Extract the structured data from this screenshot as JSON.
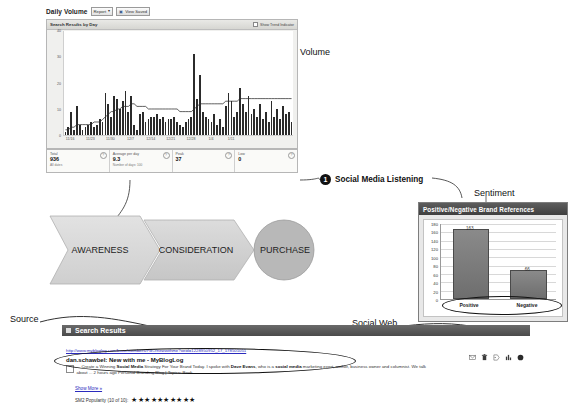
{
  "diagram": {
    "labels": {
      "volume": "Volume",
      "sentiment": "Sentiment",
      "source": "Source",
      "social_web": "Social Web"
    },
    "callout": {
      "number": "1",
      "text": "Social Media Listening"
    },
    "funnel": {
      "stages": [
        "AWARENESS",
        "CONSIDERATION",
        "PURCHASE"
      ]
    }
  },
  "volume_panel": {
    "title": "Daily Volume",
    "report_select": {
      "value": "Report",
      "caret": "▾"
    },
    "view_button": {
      "label": "View Saved",
      "icon": "disk-icon"
    },
    "card_header": "Search Results by Day",
    "card_header_checkbox": "Show Trend Indicator",
    "stats": [
      {
        "label": "Total",
        "value": "936",
        "sub": "All dates",
        "help": "?"
      },
      {
        "label": "Average per day",
        "value": "9.3",
        "sub": "Number of days: 100",
        "help": "?"
      },
      {
        "label": "Peak",
        "value": "37",
        "sub": "",
        "help": "?"
      },
      {
        "label": "Low",
        "value": "0",
        "sub": "",
        "help": "?"
      }
    ]
  },
  "sentiment_panel": {
    "title": "Positive/Negative Brand References"
  },
  "search_results": {
    "header": "Search Results",
    "result": {
      "url": "http://www.mybloglog.com/buzz/members/PBO/newwithme?oeid=1228950952_17_178501051",
      "title": "dan.schawbel: New with me - MyBlogLog",
      "snippet_pre": "... Create a Winning ",
      "snippet_b1": "Social Media",
      "snippet_mid1": " Strategy For Your Brand Today. I spoke with ",
      "snippet_b2": "Dave Evans",
      "snippet_mid2": ", who is a ",
      "snippet_b3": "social media",
      "snippet_post": " marketing exert, author, business owner and columnist. We talk about ...  2 hours ago Personal Branding Blog | Topics: Book ...",
      "show_more": "Show More »",
      "popularity_label": "SM2 Popularity (10 of 10):",
      "stars": "★★★★★★★★★★"
    },
    "action_icons": [
      "envelope-icon",
      "trash-icon",
      "tag-icon",
      "chart-icon",
      "circle-icon"
    ]
  },
  "chart_data": [
    {
      "type": "bar",
      "title": "Search Results by Day",
      "xlabel": "",
      "ylabel": "",
      "ylim": [
        0,
        40
      ],
      "yticks": [
        0,
        10,
        20,
        30,
        40
      ],
      "grid": false,
      "categories": [
        "11/16",
        "11/23",
        "11/30",
        "12/7",
        "12/14",
        "12/21",
        "12/28",
        "1/4",
        "1/11"
      ],
      "tick_positions": [
        2,
        9,
        16,
        23,
        30,
        37,
        44,
        51,
        58
      ],
      "values": [
        1,
        3,
        9,
        2,
        11,
        4,
        2,
        3,
        4,
        5,
        3,
        4,
        6,
        5,
        16,
        12,
        7,
        15,
        14,
        10,
        13,
        17,
        9,
        15,
        4,
        2,
        8,
        9,
        5,
        6,
        7,
        7,
        8,
        6,
        7,
        5,
        6,
        6,
        7,
        5,
        4,
        3,
        5,
        6,
        7,
        31,
        14,
        23,
        9,
        7,
        6,
        5,
        8,
        4,
        6,
        3,
        11,
        16,
        13,
        7,
        9,
        18,
        12,
        9,
        15,
        8,
        10,
        7,
        12,
        6,
        9,
        5,
        13,
        7,
        10,
        6,
        11,
        8,
        9,
        5
      ],
      "series": [
        {
          "name": "Trend",
          "type": "line",
          "values": [
            2,
            2,
            3,
            3,
            4,
            4,
            4,
            4,
            4,
            4,
            5,
            5,
            5,
            6,
            7,
            8,
            9,
            9,
            10,
            10,
            11,
            11,
            11,
            12,
            12,
            11,
            11,
            11,
            11,
            10,
            10,
            10,
            10,
            10,
            10,
            10,
            10,
            10,
            10,
            10,
            9,
            9,
            9,
            9,
            9,
            10,
            11,
            12,
            12,
            12,
            12,
            12,
            12,
            12,
            12,
            12,
            13,
            13,
            13,
            13,
            13,
            14,
            14,
            14,
            14,
            14,
            14,
            14,
            14,
            14,
            14,
            14,
            14,
            14,
            14,
            14,
            14,
            14,
            14,
            14
          ]
        }
      ]
    },
    {
      "type": "bar",
      "title": "Positive/Negative Brand References",
      "xlabel": "",
      "ylabel": "",
      "ylim": [
        0,
        180
      ],
      "yticks": [
        0,
        20,
        40,
        60,
        80,
        100,
        120,
        140,
        160,
        180
      ],
      "grid": true,
      "categories": [
        "Positive",
        "Negative"
      ],
      "values": [
        163,
        66
      ],
      "data_labels": [
        "163",
        "66"
      ]
    }
  ],
  "colors": {
    "bar_dark": "#2b2b2b",
    "sentiment_bar": "#6e6e6e",
    "link": "#2b2bbd",
    "header_dark": "#4a4a4a"
  }
}
